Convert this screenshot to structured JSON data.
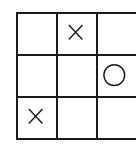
{
  "game": {
    "name": "tic-tac-toe",
    "rows": 3,
    "cols": 3,
    "board": [
      [
        "",
        "X",
        ""
      ],
      [
        "",
        "",
        "O"
      ],
      [
        "X",
        "",
        ""
      ]
    ]
  },
  "colors": {
    "line": "#1a1a1a",
    "background": "#ffffff"
  }
}
